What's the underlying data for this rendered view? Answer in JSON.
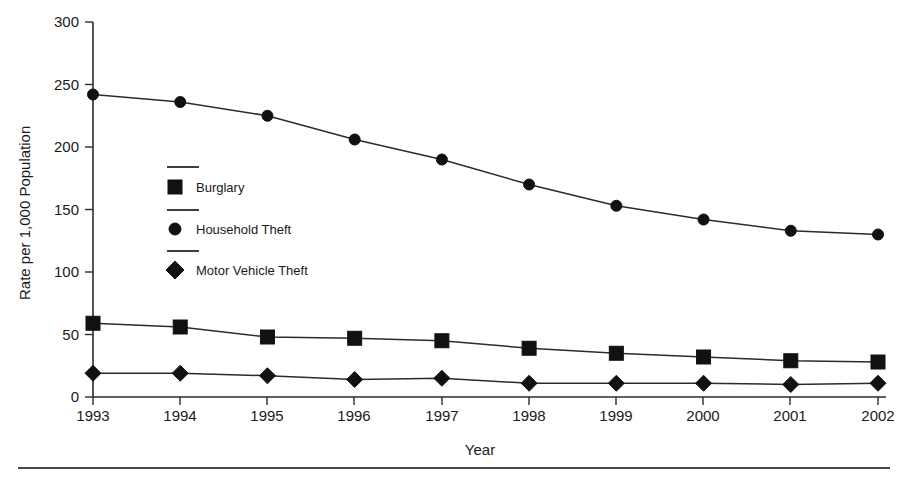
{
  "chart_data": {
    "type": "line",
    "title": "",
    "xlabel": "Year",
    "ylabel": "Rate per 1,000 Population",
    "categories": [
      "1993",
      "1994",
      "1995",
      "1996",
      "1997",
      "1998",
      "1999",
      "2000",
      "2001",
      "2002"
    ],
    "x": [
      1993,
      1994,
      1995,
      1996,
      1997,
      1998,
      1999,
      2000,
      2001,
      2002
    ],
    "xlim": [
      1993,
      2002
    ],
    "ylim": [
      0,
      300
    ],
    "yticks": [
      0,
      50,
      100,
      150,
      200,
      250,
      300
    ],
    "ytick_labels": [
      "0",
      "50",
      "100",
      "150",
      "200",
      "250",
      "300"
    ],
    "grid": false,
    "legend_position": "inside-left",
    "series": [
      {
        "name": "Burglary",
        "marker": "square",
        "values": [
          59,
          56,
          48,
          47,
          45,
          39,
          35,
          32,
          29,
          28
        ]
      },
      {
        "name": "Household Theft",
        "marker": "circle",
        "values": [
          242,
          236,
          225,
          206,
          190,
          170,
          153,
          142,
          133,
          130
        ]
      },
      {
        "name": "Motor Vehicle Theft",
        "marker": "diamond",
        "values": [
          19,
          19,
          17,
          14,
          15,
          11,
          11,
          11,
          10,
          11
        ]
      }
    ]
  },
  "axes": {
    "y_title": "Rate per 1,000 Population",
    "x_title": "Year",
    "y_ticks": [
      "300",
      "250",
      "200",
      "150",
      "100",
      "50",
      "0"
    ],
    "x_ticks": [
      "1993",
      "1994",
      "1995",
      "1996",
      "1997",
      "1998",
      "1999",
      "2000",
      "2001",
      "2002"
    ]
  },
  "legend": {
    "entries": [
      {
        "label": "Burglary",
        "marker": "square-marker"
      },
      {
        "label": "Household Theft",
        "marker": "circle-marker"
      },
      {
        "label": "Motor Vehicle Theft",
        "marker": "diamond-marker"
      }
    ]
  },
  "colors": {
    "ink": "#1a1a1a",
    "axis": "#2b2b2b",
    "marker": "#111111",
    "rule": "#4a4a4a",
    "background": "#ffffff"
  }
}
